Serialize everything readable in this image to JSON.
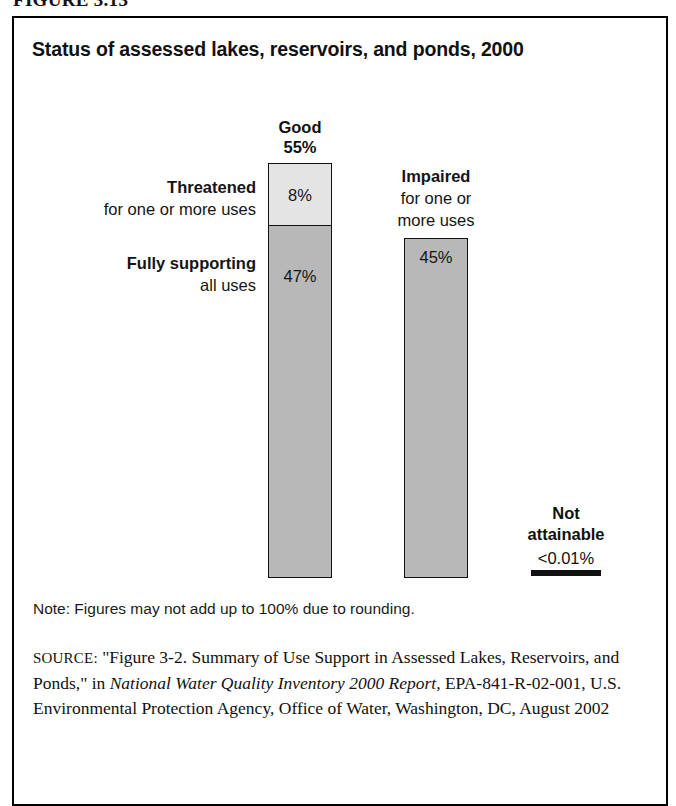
{
  "figure_number": "FIGURE 3.13",
  "chart_title": "Status of assessed lakes, reservoirs, and ponds, 2000",
  "labels": {
    "good_head": "Good",
    "good_pct": "55%",
    "threatened_head": "Threatened",
    "threatened_sub": "for one or more uses",
    "threatened_pct": "8%",
    "fully_supporting_head": "Fully supporting",
    "fully_supporting_sub": "all uses",
    "fully_supporting_pct": "47%",
    "impaired_head": "Impaired",
    "impaired_sub_line1": "for one or",
    "impaired_sub_line2": "more uses",
    "impaired_pct": "45%",
    "not_attainable_head_line1": "Not",
    "not_attainable_head_line2": "attainable",
    "not_attainable_pct": "<0.01%"
  },
  "note": "Note: Figures may not add up to 100% due to rounding.",
  "source": {
    "prefix": "SOURCE:",
    "part1": " \"Figure 3-2. Summary of Use Support in Assessed Lakes, Reservoirs, and Ponds,\" in ",
    "italic1": "National Water Quality Inventory 2000 Report,",
    "part2": " EPA-841-R-02-001, U.S. Environmental Protection Agency, Office of Water, Washington, DC, August 2002"
  },
  "colors": {
    "threatened_fill": "#e4e4e4",
    "supporting_fill": "#b8b8b8",
    "impaired_fill": "#b8b8b8",
    "outline": "#111111"
  },
  "chart_data": {
    "type": "bar",
    "title": "Status of assessed lakes, reservoirs, and ponds, 2000",
    "xlabel": "",
    "ylabel": "Percent of assessed lake acres",
    "ylim": [
      0,
      55
    ],
    "grid": false,
    "legend": "none",
    "categories": [
      "Good",
      "Impaired for one or more uses",
      "Not attainable"
    ],
    "values": [
      55,
      45,
      0.01
    ],
    "stacked_series": [
      {
        "name": "Threatened for one or more uses",
        "category": "Good",
        "value": 8,
        "label": "8%"
      },
      {
        "name": "Fully supporting all uses",
        "category": "Good",
        "value": 47,
        "label": "47%"
      }
    ],
    "annotations": [
      {
        "text": "Good 55%",
        "target": "bar-1-total"
      },
      {
        "text": "Impaired for one or more uses 45%",
        "target": "bar-2"
      },
      {
        "text": "Not attainable <0.01%",
        "target": "bar-3"
      }
    ],
    "note": "Note: Figures may not add up to 100% due to rounding."
  }
}
